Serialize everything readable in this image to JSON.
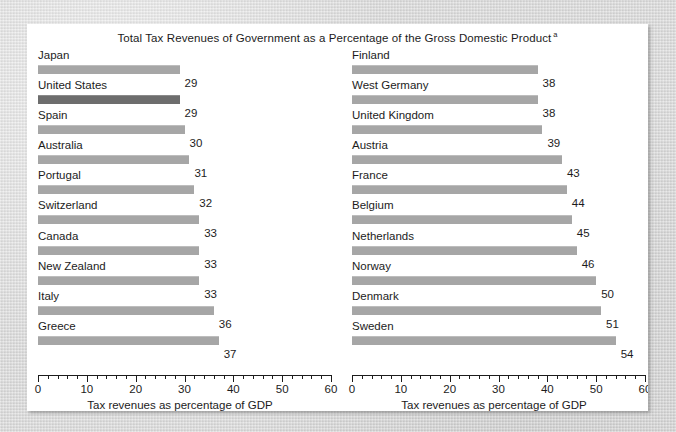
{
  "chart_data": {
    "type": "bar",
    "title": "Total Tax Revenues of Government as a Percentage of the Gross Domestic Product",
    "title_footnote_marker": "a",
    "orientation": "horizontal",
    "xlabel": "Tax revenues as percentage of GDP",
    "ylabel": "",
    "xlim": [
      0,
      60
    ],
    "xticks": [
      0,
      10,
      20,
      30,
      40,
      50,
      60
    ],
    "xtick_labels": [
      "0",
      "10",
      "20",
      "30",
      "40",
      "50",
      "60"
    ],
    "minor_tick_interval": 2,
    "grid": false,
    "legend": null,
    "bar_color": "#a6a6a6",
    "highlight_color": "#6d6d6d",
    "highlighted_category": "United States",
    "panels": [
      {
        "name": "left-panel",
        "categories": [
          "Japan",
          "United States",
          "Spain",
          "Australia",
          "Portugal",
          "Switzerland",
          "Canada",
          "New Zealand",
          "Italy",
          "Greece"
        ],
        "values": [
          29,
          29,
          30,
          31,
          32,
          33,
          33,
          33,
          36,
          37
        ],
        "highlight": [
          false,
          true,
          false,
          false,
          false,
          false,
          false,
          false,
          false,
          false
        ],
        "xlabel": "Tax revenues as percentage of GDP"
      },
      {
        "name": "right-panel",
        "categories": [
          "Finland",
          "West Germany",
          "United Kingdom",
          "Austria",
          "France",
          "Belgium",
          "Netherlands",
          "Norway",
          "Denmark",
          "Sweden"
        ],
        "values": [
          38,
          38,
          39,
          43,
          44,
          45,
          46,
          50,
          51,
          54
        ],
        "highlight": [
          false,
          false,
          false,
          false,
          false,
          false,
          false,
          false,
          false,
          false
        ],
        "xlabel": "Tax revenues as percentage of GDP"
      }
    ]
  }
}
